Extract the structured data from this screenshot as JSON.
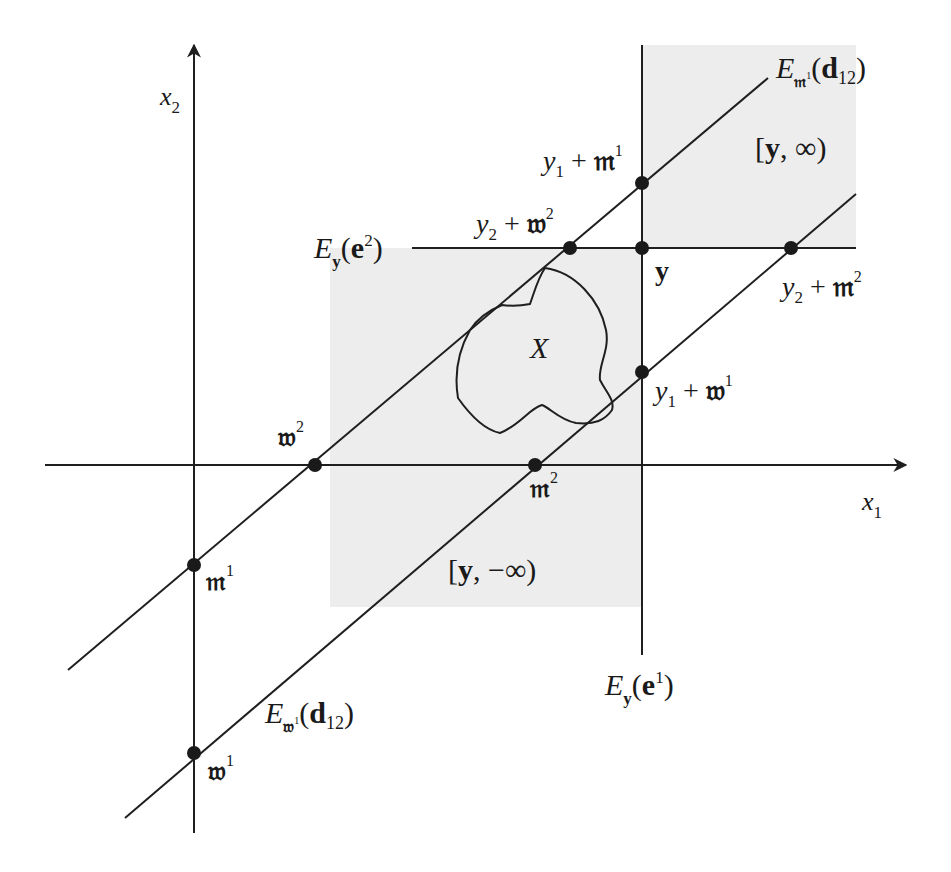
{
  "diagram": {
    "colors": {
      "line": "#1f1f1f",
      "shade": "#ededed",
      "point": "#1a1a1a",
      "background": "#ffffff"
    },
    "axes": {
      "x1": {
        "label": "x",
        "sub": "1"
      },
      "x2": {
        "label": "x",
        "sub": "2"
      }
    },
    "lines": {
      "upper_diagonal": {
        "label_E": "E",
        "sub_sym": "𝔪",
        "sub_sup": "1",
        "arg_open": "(",
        "arg": "d",
        "arg_sub": "12",
        "arg_close": ")"
      },
      "lower_diagonal": {
        "label_E": "E",
        "sub_sym": "𝔴",
        "sub_sup": "1",
        "arg_open": "(",
        "arg": "d",
        "arg_sub": "12",
        "arg_close": ")"
      },
      "horizontal": {
        "label_E": "E",
        "sub": "y",
        "arg_open": "(",
        "arg": "e",
        "arg_sup": "2",
        "arg_close": ")"
      },
      "vertical": {
        "label_E": "E",
        "sub": "y",
        "arg_open": "(",
        "arg": "e",
        "arg_sup": "1",
        "arg_close": ")"
      }
    },
    "regions": {
      "upper_cone": {
        "open": "[",
        "var": "y",
        "rest": ", ∞)"
      },
      "lower_cone": {
        "open": "[",
        "var": "y",
        "rest": ", −∞)"
      },
      "set": {
        "label": "X"
      }
    },
    "points": [
      {
        "id": "m1",
        "sym": "𝔪",
        "sup": "1"
      },
      {
        "id": "w2",
        "sym": "𝔴",
        "sup": "2"
      },
      {
        "id": "w1",
        "sym": "𝔴",
        "sup": "1"
      },
      {
        "id": "m2",
        "sym": "𝔪",
        "sup": "2"
      },
      {
        "id": "y",
        "sym": "y"
      },
      {
        "id": "y1_plus_m1",
        "pre": "y",
        "pre_sub": "1",
        "op": " + ",
        "sym": "𝔪",
        "sup": "1"
      },
      {
        "id": "y2_plus_w2",
        "pre": "y",
        "pre_sub": "2",
        "op": " + ",
        "sym": "𝔴",
        "sup": "2"
      },
      {
        "id": "y1_plus_w1",
        "pre": "y",
        "pre_sub": "1",
        "op": " + ",
        "sym": "𝔴",
        "sup": "1"
      },
      {
        "id": "y2_plus_m2",
        "pre": "y",
        "pre_sub": "2",
        "op": " + ",
        "sym": "𝔪",
        "sup": "2"
      }
    ]
  }
}
